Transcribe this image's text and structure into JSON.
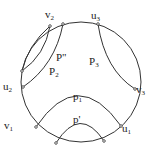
{
  "diagram": {
    "type": "disk-with-chords",
    "circle": {
      "cx": 81,
      "cy": 82,
      "r": 60
    },
    "labels": [
      {
        "id": "v2",
        "base": "v",
        "sub": "2",
        "x": 45,
        "y": 18
      },
      {
        "id": "u3",
        "base": "u",
        "sub": "3",
        "x": 91,
        "y": 19
      },
      {
        "id": "Ppp",
        "base": "P\"",
        "sub": "",
        "x": 56,
        "y": 61
      },
      {
        "id": "P3",
        "base": "P",
        "sub": "3",
        "x": 89,
        "y": 65
      },
      {
        "id": "P2",
        "base": "P",
        "sub": "2",
        "x": 49,
        "y": 75
      },
      {
        "id": "u2",
        "base": "u",
        "sub": "2",
        "x": 3,
        "y": 90
      },
      {
        "id": "v3",
        "base": "v",
        "sub": "3",
        "x": 136,
        "y": 93
      },
      {
        "id": "p1",
        "base": "p",
        "sub": "1",
        "x": 73,
        "y": 100
      },
      {
        "id": "v1",
        "base": "v",
        "sub": "1",
        "x": 4,
        "y": 129
      },
      {
        "id": "pp",
        "base": "p'",
        "sub": "",
        "x": 73,
        "y": 123
      },
      {
        "id": "u1",
        "base": "u",
        "sub": "1",
        "x": 122,
        "y": 132
      }
    ],
    "points": [
      {
        "id": "v2",
        "x": 50,
        "y": 26
      },
      {
        "id": "v2b",
        "x": 63,
        "y": 24
      },
      {
        "id": "u3",
        "x": 98,
        "y": 24
      },
      {
        "id": "pL",
        "x": 22,
        "y": 71
      },
      {
        "id": "u2",
        "x": 23,
        "y": 87
      },
      {
        "id": "v3",
        "x": 135,
        "y": 89
      },
      {
        "id": "v1",
        "x": 36,
        "y": 127
      },
      {
        "id": "u1",
        "x": 121,
        "y": 126
      },
      {
        "id": "pb",
        "x": 56,
        "y": 143
      },
      {
        "id": "pbr",
        "x": 104,
        "y": 141
      }
    ],
    "chords": [
      {
        "name": "P''-outer",
        "d": "M50,26 Q28,45 22,71"
      },
      {
        "name": "P''-inner",
        "d": "M50,26 Q45,55 22,71"
      },
      {
        "name": "P2-arc",
        "d": "M63,24 Q55,65 23,87"
      },
      {
        "name": "P3-arc",
        "d": "M98,24 Q105,70 135,89"
      },
      {
        "name": "p1-arc",
        "d": "M36,127 Q78,65 121,126"
      },
      {
        "name": "p'-arc",
        "d": "M56,143 Q80,105 104,141"
      }
    ]
  }
}
